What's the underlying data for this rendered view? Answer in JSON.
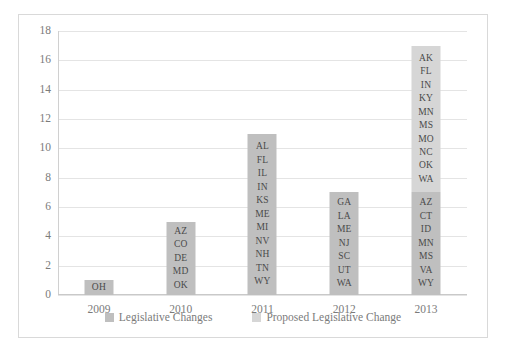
{
  "chart_data": {
    "type": "bar",
    "title": "",
    "subtitle": "",
    "xlabel": "",
    "ylabel": "",
    "categories": [
      "2009",
      "2010",
      "2011",
      "2012",
      "2013"
    ],
    "ylim": [
      0,
      18
    ],
    "ytick_values": [
      0,
      2,
      4,
      6,
      8,
      10,
      12,
      14,
      16,
      18
    ],
    "ytick_labels": [
      "0",
      "2",
      "4",
      "6",
      "8",
      "10",
      "12",
      "14",
      "16",
      "18"
    ],
    "grid": true,
    "stacked": true,
    "legend_position": "bottom",
    "series": [
      {
        "name": "Legislative Changes",
        "color": "#bfbfbf",
        "values": [
          1,
          5,
          11,
          7,
          7
        ]
      },
      {
        "name": "Proposed Legislative Change",
        "color": "#d6d6d6",
        "values": [
          0,
          0,
          0,
          0,
          10
        ]
      }
    ],
    "totals": [
      1,
      5,
      11,
      7,
      17
    ],
    "bar_labels": [
      {
        "category": "2009",
        "segments": [
          {
            "series": "Legislative Changes",
            "value": 1,
            "states": [
              "OH"
            ]
          }
        ]
      },
      {
        "category": "2010",
        "segments": [
          {
            "series": "Legislative Changes",
            "value": 5,
            "states": [
              "AZ",
              "CO",
              "DE",
              "MD",
              "OK"
            ]
          }
        ]
      },
      {
        "category": "2011",
        "segments": [
          {
            "series": "Legislative Changes",
            "value": 11,
            "states": [
              "AL",
              "FL",
              "IL",
              "IN",
              "KS",
              "ME",
              "MI",
              "NV",
              "NH",
              "TN",
              "WY"
            ]
          }
        ]
      },
      {
        "category": "2012",
        "segments": [
          {
            "series": "Legislative Changes",
            "value": 7,
            "states": [
              "GA",
              "LA",
              "ME",
              "NJ",
              "SC",
              "UT",
              "WA"
            ]
          }
        ]
      },
      {
        "category": "2013",
        "segments": [
          {
            "series": "Legislative Changes",
            "value": 7,
            "states": [
              "AZ",
              "CT",
              "ID",
              "MN",
              "MS",
              "VA",
              "WY"
            ]
          },
          {
            "series": "Proposed Legislative Change",
            "value": 10,
            "states": [
              "AK",
              "FL",
              "IN",
              "KY",
              "MN",
              "MS",
              "MO",
              "NC",
              "OK",
              "WA"
            ]
          }
        ]
      }
    ],
    "legend": [
      {
        "label": "Legislative Changes",
        "color": "#bfbfbf"
      },
      {
        "label": "Proposed Legislative Change",
        "color": "#d6d6d6"
      }
    ]
  }
}
